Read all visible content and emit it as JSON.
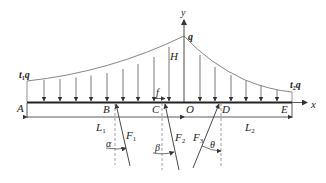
{
  "diagram": {
    "type": "beam-load-diagram",
    "colors": {
      "line": "#333333",
      "light": "#777777",
      "text": "#222222",
      "background": "#ffffff"
    },
    "axes": {
      "x_label": "x",
      "y_label": "y"
    },
    "points": {
      "A": "A",
      "B": "B",
      "C": "C",
      "O": "O",
      "D": "D",
      "E": "E"
    },
    "loads": {
      "peak": "q",
      "left_end": {
        "main": "t",
        "sub": "1",
        "tail": "q"
      },
      "right_end": {
        "main": "t",
        "sub": "2",
        "tail": "q"
      },
      "height": "H",
      "friction": "f"
    },
    "dimensions": {
      "left": {
        "main": "L",
        "sub": "1"
      },
      "right": {
        "main": "L",
        "sub": "2"
      }
    },
    "forces": [
      {
        "main": "F",
        "sub": "1",
        "angle": "α"
      },
      {
        "main": "F",
        "sub": "2",
        "angle": "β"
      },
      {
        "main": "F",
        "sub": "3",
        "angle": "θ"
      }
    ]
  }
}
